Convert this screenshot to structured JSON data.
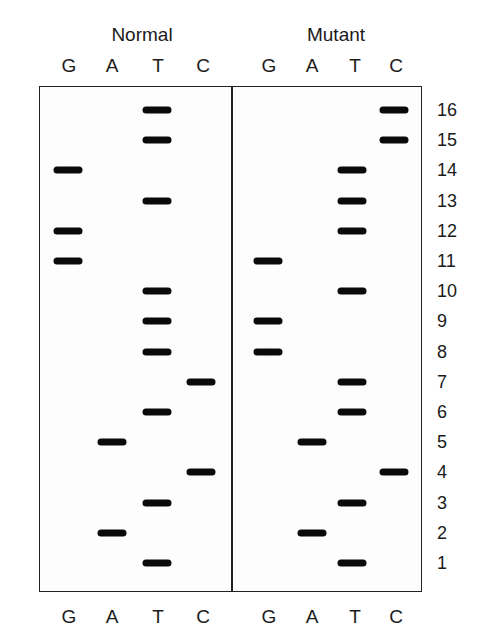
{
  "panels": [
    {
      "title": "Normal",
      "lanes": [
        "G",
        "A",
        "T",
        "C"
      ]
    },
    {
      "title": "Mutant",
      "lanes": [
        "G",
        "A",
        "T",
        "C"
      ]
    }
  ],
  "row_numbers": [
    "16",
    "15",
    "14",
    "13",
    "12",
    "11",
    "10",
    "9",
    "8",
    "7",
    "6",
    "5",
    "4",
    "3",
    "2",
    "1"
  ],
  "bands": {
    "normal": [
      {
        "row": 16,
        "lane": "T"
      },
      {
        "row": 15,
        "lane": "T"
      },
      {
        "row": 14,
        "lane": "G"
      },
      {
        "row": 13,
        "lane": "T"
      },
      {
        "row": 12,
        "lane": "G"
      },
      {
        "row": 11,
        "lane": "G"
      },
      {
        "row": 10,
        "lane": "T"
      },
      {
        "row": 9,
        "lane": "T"
      },
      {
        "row": 8,
        "lane": "T"
      },
      {
        "row": 7,
        "lane": "C"
      },
      {
        "row": 6,
        "lane": "T"
      },
      {
        "row": 5,
        "lane": "A"
      },
      {
        "row": 4,
        "lane": "C"
      },
      {
        "row": 3,
        "lane": "T"
      },
      {
        "row": 2,
        "lane": "A"
      },
      {
        "row": 1,
        "lane": "T"
      }
    ],
    "mutant": [
      {
        "row": 16,
        "lane": "C"
      },
      {
        "row": 15,
        "lane": "C"
      },
      {
        "row": 14,
        "lane": "T"
      },
      {
        "row": 13,
        "lane": "T"
      },
      {
        "row": 12,
        "lane": "T"
      },
      {
        "row": 11,
        "lane": "G"
      },
      {
        "row": 10,
        "lane": "T"
      },
      {
        "row": 9,
        "lane": "G"
      },
      {
        "row": 8,
        "lane": "G"
      },
      {
        "row": 7,
        "lane": "T"
      },
      {
        "row": 6,
        "lane": "T"
      },
      {
        "row": 5,
        "lane": "A"
      },
      {
        "row": 4,
        "lane": "C"
      },
      {
        "row": 3,
        "lane": "T"
      },
      {
        "row": 2,
        "lane": "A"
      },
      {
        "row": 1,
        "lane": "T"
      }
    ]
  },
  "sequence_read_5to3": {
    "normal": "TAGCATTTTGGGTGTT",
    "mutant": "TAGCATTGGTGTTTCC"
  },
  "colors": {
    "band": "#0a0a0a",
    "border": "#222222",
    "background": "#ffffff"
  }
}
